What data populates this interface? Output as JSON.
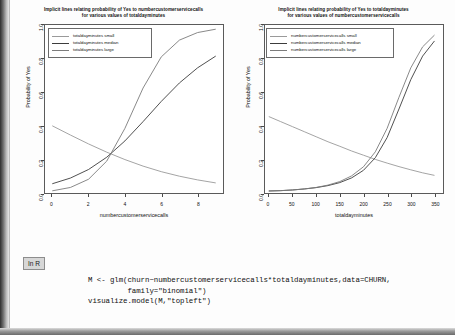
{
  "badge": {
    "label": "In R"
  },
  "code": {
    "lines": [
      "M <- glm(churn~numbercustomerservicecalls*totaldayminutes,data=CHURN,",
      "         family=\"binomial\")",
      "visualize.model(M,\"topleft\")"
    ]
  },
  "charts": [
    {
      "id": "left",
      "title_line1": "Implicit lines relating probability of Yes to numbercustomerservicecalls",
      "title_line2": "for various values of totaldayminutes",
      "legend": [
        {
          "label": "totaldayminutes small",
          "color": "#9a9a9a"
        },
        {
          "label": "totaldayminutes median",
          "color": "#3c3c3c"
        },
        {
          "label": "totaldayminutes large",
          "color": "#7c7c7c"
        }
      ],
      "chart_data": {
        "type": "line",
        "title": "Implicit lines relating probability of Yes to numbercustomerservicecalls for various values of totaldayminutes",
        "xlabel": "numbercustomerservicecalls",
        "ylabel": "Probability of Yes",
        "xlim": [
          -0.4,
          9.4
        ],
        "ylim": [
          0.0,
          1.0
        ],
        "xticks": [
          "0",
          "2",
          "4",
          "6",
          "8"
        ],
        "xtick_values": [
          0,
          2,
          4,
          6,
          8
        ],
        "yticks": [
          "0.0",
          "0.2",
          "0.4",
          "0.6",
          "0.8",
          "1.0"
        ],
        "ytick_values": [
          0.0,
          0.2,
          0.4,
          0.6,
          0.8,
          1.0
        ],
        "grid": false,
        "legend_position": "topleft",
        "x": [
          0,
          1,
          2,
          3,
          4,
          5,
          6,
          7,
          8,
          9
        ],
        "series": [
          {
            "name": "totaldayminutes small",
            "values": [
              0.4,
              0.345,
              0.292,
              0.243,
              0.199,
              0.16,
              0.127,
              0.1,
              0.078,
              0.06
            ]
          },
          {
            "name": "totaldayminutes median",
            "values": [
              0.055,
              0.089,
              0.14,
              0.213,
              0.31,
              0.425,
              0.545,
              0.655,
              0.745,
              0.815
            ]
          },
          {
            "name": "totaldayminutes large",
            "values": [
              0.013,
              0.033,
              0.082,
              0.19,
              0.385,
              0.625,
              0.81,
              0.91,
              0.955,
              0.975
            ]
          }
        ]
      }
    },
    {
      "id": "right",
      "title_line1": "Implicit lines relating probability of Yes to totaldayminutes",
      "title_line2": "for various values of numbercustomerservicecalls",
      "legend": [
        {
          "label": "numbercustomerservicecalls small",
          "color": "#9a9a9a"
        },
        {
          "label": "numbercustomerservicecalls median",
          "color": "#3c3c3c"
        },
        {
          "label": "numbercustomerservicecalls large",
          "color": "#7c7c7c"
        }
      ],
      "chart_data": {
        "type": "line",
        "title": "Implicit lines relating probability of Yes to totaldayminutes for various values of numbercustomerservicecalls",
        "xlabel": "totaldayminutes",
        "ylabel": "Probability of Yes",
        "xlim": [
          -8,
          368
        ],
        "ylim": [
          0.0,
          1.0
        ],
        "xticks": [
          "0",
          "50",
          "100",
          "150",
          "200",
          "250",
          "300",
          "350"
        ],
        "xtick_values": [
          0,
          50,
          100,
          150,
          200,
          250,
          300,
          350
        ],
        "yticks": [
          "0.0",
          "0.2",
          "0.4",
          "0.6",
          "0.8",
          "1.0"
        ],
        "ytick_values": [
          0.0,
          0.2,
          0.4,
          0.6,
          0.8,
          1.0
        ],
        "grid": false,
        "legend_position": "topleft",
        "x": [
          0,
          25,
          50,
          75,
          100,
          125,
          150,
          175,
          200,
          225,
          250,
          275,
          300,
          325,
          350
        ],
        "series": [
          {
            "name": "numbercustomerservicecalls small",
            "values": [
              0.455,
              0.425,
              0.395,
              0.365,
              0.335,
              0.305,
              0.278,
              0.25,
              0.225,
              0.2,
              0.178,
              0.157,
              0.138,
              0.12,
              0.105
            ]
          },
          {
            "name": "numbercustomerservicecalls median",
            "values": [
              0.012,
              0.014,
              0.018,
              0.024,
              0.032,
              0.044,
              0.062,
              0.09,
              0.135,
              0.21,
              0.33,
              0.5,
              0.675,
              0.815,
              0.905
            ]
          },
          {
            "name": "numbercustomerservicecalls large",
            "values": [
              0.012,
              0.014,
              0.018,
              0.024,
              0.033,
              0.047,
              0.068,
              0.102,
              0.156,
              0.245,
              0.385,
              0.57,
              0.745,
              0.87,
              0.94
            ]
          }
        ]
      }
    }
  ]
}
